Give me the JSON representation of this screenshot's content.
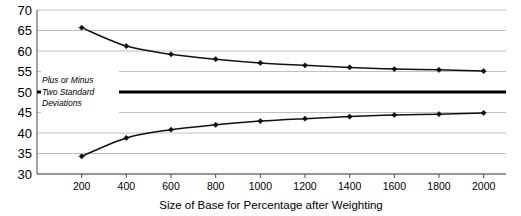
{
  "chart_data": {
    "type": "line",
    "title": "",
    "xlabel": "Size of Base for Percentage after Weighting",
    "ylabel": "",
    "x": [
      200,
      400,
      600,
      800,
      1000,
      1200,
      1400,
      1600,
      1800,
      2000
    ],
    "xtick_labels": [
      "200",
      "400",
      "600",
      "800",
      "1000",
      "1200",
      "1400",
      "1600",
      "1800",
      "2000"
    ],
    "ytick_labels": [
      "70",
      "65",
      "60",
      "55",
      "50",
      "45",
      "40",
      "35",
      "30"
    ],
    "yticks": [
      70,
      65,
      60,
      55,
      50,
      45,
      40,
      35,
      30
    ],
    "xlim": [
      0,
      2100
    ],
    "ylim": [
      30,
      70
    ],
    "grid": true,
    "legend": "none",
    "series": [
      {
        "name": "Upper bound (plus two standard deviations)",
        "values": [
          65.7,
          61.2,
          59.2,
          58.0,
          57.1,
          56.5,
          56.0,
          55.6,
          55.4,
          55.1
        ],
        "color": "#111111",
        "marker": "diamond"
      },
      {
        "name": "Lower bound (minus two standard deviations)",
        "values": [
          34.3,
          38.8,
          40.8,
          42.0,
          42.9,
          43.5,
          44.0,
          44.4,
          44.6,
          44.9
        ],
        "color": "#111111",
        "marker": "diamond"
      }
    ],
    "reference_line": {
      "value": 50,
      "color": "#000000",
      "width": 3.2
    },
    "annotations": [
      {
        "text_lines": [
          "Plus or Minus",
          "Two Standard",
          "Deviations"
        ],
        "line1": "Plus or Minus",
        "line2": "Two Standard",
        "line3": "Deviations",
        "style": "italic",
        "at_x": 250,
        "at_y": 50
      }
    ]
  },
  "axis": {
    "x_title": "Size of Base for Percentage after Weighting"
  },
  "colors": {
    "grid": "#b0b0b0",
    "axis": "#4d4d4d",
    "series": "#111111",
    "reference": "#000000",
    "background": "#ffffff"
  }
}
